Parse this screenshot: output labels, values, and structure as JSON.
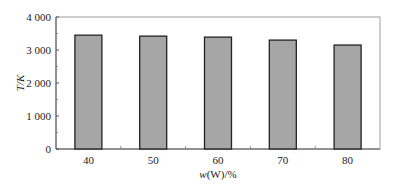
{
  "chart_data": {
    "type": "bar",
    "title": "",
    "xlabel_italic": "w",
    "xlabel_rest": "(W)/%",
    "xlabel": "w(W)/%",
    "ylabel": "T/K",
    "categories": [
      "40",
      "50",
      "60",
      "70",
      "80"
    ],
    "values": [
      3450,
      3420,
      3390,
      3300,
      3150
    ],
    "ylim": [
      0,
      4000
    ],
    "yticks": [
      0,
      1000,
      2000,
      3000,
      4000
    ],
    "ytick_labels": [
      "0",
      "1 000",
      "2 000",
      "3 000",
      "4 000"
    ],
    "grid": false,
    "legend": "none",
    "colors": {
      "bar_fill": "#a6a6a6",
      "bar_edge": "#222222",
      "axis": "#555555"
    }
  }
}
